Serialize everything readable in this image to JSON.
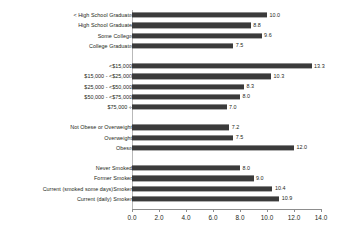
{
  "chart_data": {
    "type": "bar",
    "orientation": "horizontal",
    "title": "",
    "subtitle": "",
    "xlabel": "",
    "ylabel": "",
    "xlim": [
      0.0,
      14.0
    ],
    "xticks": [
      "0.0",
      "2.0",
      "4.0",
      "6.0",
      "8.0",
      "10.0",
      "12.0",
      "14.0"
    ],
    "xtick_values": [
      0,
      2,
      4,
      6,
      8,
      10,
      12,
      14
    ],
    "grid": false,
    "legend": false,
    "bar_color": "#3b3b3b",
    "axis_color": "#8d8d8d",
    "text_color": "#231f20",
    "categories": [
      "< High School Graduate",
      "High School Graduate",
      "Some College",
      "College Graduate",
      "<$15,000",
      "$15,000 - <$25,000",
      "$25,000 - <$50,000",
      "$50,000 - <$75,000",
      "$75,000 +",
      "Not Obese or Overweight",
      "Overweight",
      "Obese",
      "Never Smoked",
      "Former Smoker",
      "Current (smoked some days)Smoker",
      "Current (daily) Smoker"
    ],
    "values": [
      10.0,
      8.8,
      9.6,
      7.5,
      13.3,
      10.3,
      8.3,
      8.0,
      7.0,
      7.2,
      7.5,
      12.0,
      8.0,
      9.0,
      10.4,
      10.9
    ],
    "value_labels": [
      "10.0",
      "8.8",
      "9.6",
      "7.5",
      "13.3",
      "10.3",
      "8.3",
      "8.0",
      "7.0",
      "7.2",
      "7.5",
      "12.0",
      "8.0",
      "9.0",
      "10.4",
      "10.9"
    ],
    "groups": [
      {
        "name": "education",
        "indices": [
          0,
          1,
          2,
          3
        ]
      },
      {
        "name": "income",
        "indices": [
          4,
          5,
          6,
          7,
          8
        ]
      },
      {
        "name": "weight-status",
        "indices": [
          9,
          10,
          11
        ]
      },
      {
        "name": "smoking-status",
        "indices": [
          12,
          13,
          14,
          15
        ]
      }
    ],
    "rows": [
      {
        "type": "bar",
        "index": 0
      },
      {
        "type": "bar",
        "index": 1
      },
      {
        "type": "bar",
        "index": 2
      },
      {
        "type": "bar",
        "index": 3
      },
      {
        "type": "spacer"
      },
      {
        "type": "bar",
        "index": 4
      },
      {
        "type": "bar",
        "index": 5
      },
      {
        "type": "bar",
        "index": 6
      },
      {
        "type": "bar",
        "index": 7
      },
      {
        "type": "bar",
        "index": 8
      },
      {
        "type": "spacer"
      },
      {
        "type": "bar",
        "index": 9
      },
      {
        "type": "bar",
        "index": 10
      },
      {
        "type": "bar",
        "index": 11
      },
      {
        "type": "spacer"
      },
      {
        "type": "bar",
        "index": 12
      },
      {
        "type": "bar",
        "index": 13
      },
      {
        "type": "bar",
        "index": 14
      },
      {
        "type": "bar",
        "index": 15
      }
    ]
  }
}
